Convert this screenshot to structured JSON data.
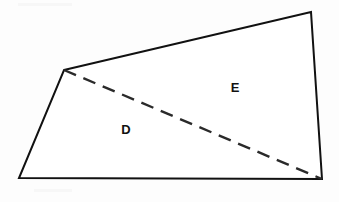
{
  "figure": {
    "type": "geometry-diagram",
    "canvas": {
      "width": 339,
      "height": 202
    },
    "background_color": "#fdfdfd",
    "stroke_color": "#111111",
    "dashed_stroke_color": "#2a2a2a",
    "label_color": "#111111"
  },
  "shape": {
    "name": "quadrilateral",
    "vertices": [
      {
        "id": "top-left",
        "x": 64,
        "y": 70
      },
      {
        "id": "top-right",
        "x": 311,
        "y": 12
      },
      {
        "id": "bottom-right",
        "x": 322,
        "y": 179
      },
      {
        "id": "bottom-left",
        "x": 19,
        "y": 178
      }
    ],
    "outline_points": "64,70 311,12 322,179 19,178",
    "edges": [
      {
        "id": "top-edge",
        "from": "top-left",
        "to": "top-right",
        "style": "solid"
      },
      {
        "id": "right-edge",
        "from": "top-right",
        "to": "bottom-right",
        "style": "solid"
      },
      {
        "id": "bottom-edge",
        "from": "bottom-right",
        "to": "bottom-left",
        "style": "solid"
      },
      {
        "id": "left-edge",
        "from": "bottom-left",
        "to": "top-left",
        "style": "solid"
      }
    ]
  },
  "diagonal": {
    "id": "dashed-diagonal",
    "style": "dashed",
    "dash_pattern": "13 8",
    "x1": 64,
    "y1": 70,
    "x2": 322,
    "y2": 179
  },
  "labels": [
    {
      "id": "region-d",
      "text": "D",
      "x": 126,
      "y": 131,
      "region": "lower-left-triangle"
    },
    {
      "id": "region-e",
      "text": "E",
      "x": 235,
      "y": 89,
      "region": "upper-right-triangle"
    }
  ]
}
